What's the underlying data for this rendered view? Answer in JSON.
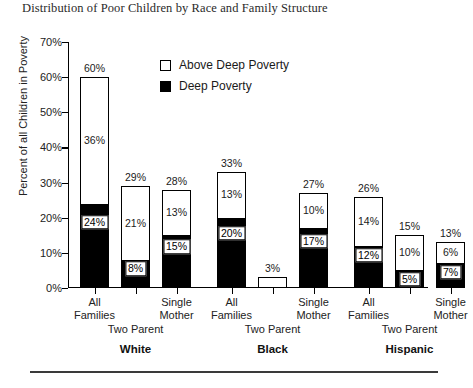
{
  "chart_data": {
    "type": "bar",
    "title": "Distribution of Poor Children by Race and Family Structure",
    "xlabel": "",
    "ylabel": "Percent of all Children in Poverty",
    "ylim": [
      0,
      70
    ],
    "ytick_labels": [
      "0%",
      "10%",
      "20%",
      "30%",
      "40%",
      "50%",
      "60%",
      "70%"
    ],
    "ytick_values": [
      0,
      10,
      20,
      30,
      40,
      50,
      60,
      70
    ],
    "grid": false,
    "stacked": true,
    "legend_position": "top-center",
    "legend": [
      {
        "name": "Above Deep Poverty",
        "color": "#ffffff",
        "swatch": "white-square"
      },
      {
        "name": "Deep Poverty",
        "color": "#000000",
        "swatch": "black-square"
      }
    ],
    "series": [
      {
        "name": "Deep Poverty",
        "values": [
          24,
          8,
          15,
          20,
          0,
          17,
          12,
          5,
          7
        ]
      },
      {
        "name": "Above Deep Poverty",
        "values": [
          36,
          21,
          13,
          13,
          3,
          10,
          14,
          10,
          6
        ]
      }
    ],
    "totals": [
      60,
      29,
      28,
      33,
      3,
      27,
      26,
      15,
      13
    ],
    "categories": [
      "All Families",
      "Two Parent",
      "Single Mother",
      "All Families",
      "Two Parent",
      "Single Mother",
      "All Families",
      "Two Parent",
      "Single Mother"
    ],
    "groups": [
      "White",
      "Black",
      "Hispanic"
    ],
    "bars": [
      {
        "group": "White",
        "category": "All Families",
        "deep": 24,
        "above": 36,
        "total": 60,
        "deep_label": "24%",
        "above_label": "36%",
        "total_label": "60%",
        "show_deep_label": true,
        "show_above_label": true
      },
      {
        "group": "White",
        "category": "Two Parent",
        "deep": 8,
        "above": 21,
        "total": 29,
        "deep_label": "8%",
        "above_label": "21%",
        "total_label": "29%",
        "show_deep_label": true,
        "show_above_label": true
      },
      {
        "group": "White",
        "category": "Single Mother",
        "deep": 15,
        "above": 13,
        "total": 28,
        "deep_label": "15%",
        "above_label": "13%",
        "total_label": "28%",
        "show_deep_label": true,
        "show_above_label": true
      },
      {
        "group": "Black",
        "category": "All Families",
        "deep": 20,
        "above": 13,
        "total": 33,
        "deep_label": "20%",
        "above_label": "13%",
        "total_label": "33%",
        "show_deep_label": true,
        "show_above_label": true
      },
      {
        "group": "Black",
        "category": "Two Parent",
        "deep": 0,
        "above": 3,
        "total": 3,
        "deep_label": "",
        "above_label": "",
        "total_label": "3%",
        "show_deep_label": false,
        "show_above_label": false
      },
      {
        "group": "Black",
        "category": "Single Mother",
        "deep": 17,
        "above": 10,
        "total": 27,
        "deep_label": "17%",
        "above_label": "10%",
        "total_label": "27%",
        "show_deep_label": true,
        "show_above_label": true
      },
      {
        "group": "Hispanic",
        "category": "All Families",
        "deep": 12,
        "above": 14,
        "total": 26,
        "deep_label": "12%",
        "above_label": "14%",
        "total_label": "26%",
        "show_deep_label": true,
        "show_above_label": true
      },
      {
        "group": "Hispanic",
        "category": "Two Parent",
        "deep": 5,
        "above": 10,
        "total": 15,
        "deep_label": "5%",
        "above_label": "10%",
        "total_label": "15%",
        "show_deep_label": true,
        "show_above_label": true
      },
      {
        "group": "Hispanic",
        "category": "Single Mother",
        "deep": 7,
        "above": 6,
        "total": 13,
        "deep_label": "7%",
        "above_label": "6%",
        "total_label": "13%",
        "show_deep_label": true,
        "show_above_label": true
      }
    ],
    "subgroup_tier_label": "Two Parent"
  },
  "axis": {
    "y_title": "Percent of all Children in Poverty"
  },
  "colors": {
    "deep_poverty": "#000000",
    "above_deep_poverty": "#ffffff",
    "axis": "#000000",
    "text": "#1a1a1a"
  }
}
